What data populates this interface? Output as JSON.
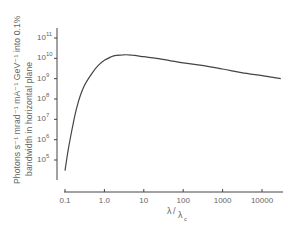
{
  "chart_data": {
    "type": "line",
    "title": "",
    "xlabel": "λ/λc",
    "ylabel_line1": "Photons s⁻¹ mrad⁻¹ mA⁻¹ GeV⁻¹ into 0.1%",
    "ylabel_line2": "bandwidth in horizontal plane",
    "xscale": "log",
    "yscale": "log",
    "x_ticks": [
      "0.1",
      "1.0",
      "10",
      "100",
      "1000",
      "10000"
    ],
    "y_ticks": [
      "10^5",
      "10^6",
      "10^7",
      "10^8",
      "10^9",
      "10^10",
      "10^11"
    ],
    "xlim": [
      0.1,
      30000
    ],
    "ylim": [
      10000,
      300000000000
    ],
    "grid": false,
    "legend": null,
    "series": [
      {
        "name": "Universal synchrotron spectrum",
        "x": [
          0.1,
          0.12,
          0.15,
          0.2,
          0.3,
          0.5,
          0.7,
          1.0,
          1.5,
          2.0,
          3.0,
          5.0,
          10,
          30,
          100,
          300,
          1000,
          3000,
          10000,
          30000
        ],
        "y": [
          30000,
          300000,
          3000000,
          40000000,
          400000000,
          2000000000,
          4500000000,
          8000000000,
          12000000000,
          14000000000,
          15000000000,
          14500000000,
          12000000000,
          9000000000,
          6000000000,
          4500000000,
          3000000000,
          2000000000,
          1400000000,
          1000000000
        ]
      }
    ]
  }
}
